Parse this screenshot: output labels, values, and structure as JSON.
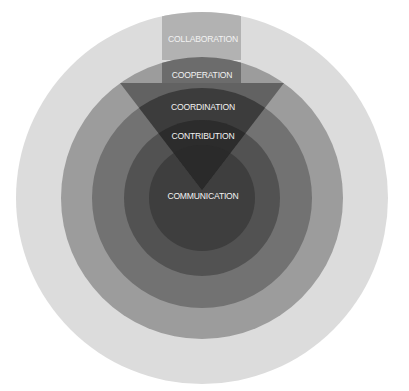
{
  "diagram": {
    "type": "concentric-circles-with-inverted-triangle",
    "center": {
      "x": 202,
      "y": 198
    },
    "rings": [
      {
        "name": "collaboration",
        "radius": 186,
        "color": "#dcdcdc"
      },
      {
        "name": "cooperation",
        "radius": 141,
        "color": "#9c9c9c"
      },
      {
        "name": "coordination",
        "radius": 110,
        "color": "#727272"
      },
      {
        "name": "contribution",
        "radius": 78,
        "color": "#525252"
      },
      {
        "name": "communication",
        "radius": 53,
        "color": "#3e3e3e"
      }
    ],
    "band": {
      "x": 162,
      "width": 79,
      "collab_color": "#b2b2b2",
      "coop_color": "#6c6c6c"
    },
    "triangle": {
      "top_y": 83,
      "left_x": 120,
      "right_x": 284,
      "apex_x": 202,
      "apex_y": 190,
      "color_ring2": "#626262",
      "color_ring3": "#3c3c3c",
      "color_ring4": "#2c2c2c",
      "color_ring5": "#2a2a2a"
    },
    "labels": {
      "collaboration": "COLLABORATION",
      "cooperation": "COOPERATION",
      "coordination": "COORDINATION",
      "contribution": "CONTRIBUTION",
      "communication": "COMMUNICATION"
    }
  }
}
